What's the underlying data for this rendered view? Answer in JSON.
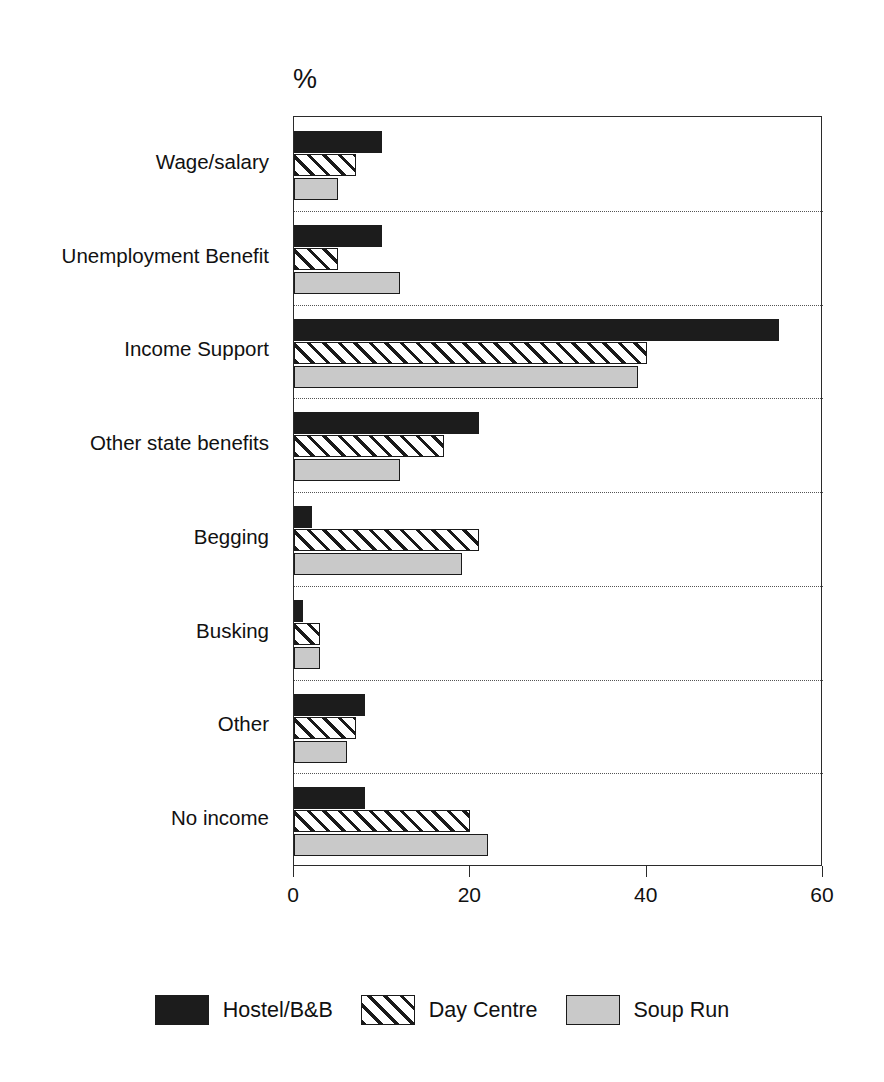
{
  "chart_data": {
    "type": "bar",
    "orientation": "horizontal",
    "title": "",
    "subtitle": "",
    "unit_label": "%",
    "xlabel": "",
    "ylabel": "",
    "xlim": [
      0,
      60
    ],
    "xticks": [
      0,
      20,
      40,
      60
    ],
    "xtick_labels": [
      "0",
      "20",
      "40",
      "60"
    ],
    "grid": "horizontal-dotted-between-groups",
    "legend_position": "bottom-center",
    "categories": [
      "Wage/salary",
      "Unemployment Benefit",
      "Income Support",
      "Other state benefits",
      "Begging",
      "Busking",
      "Other",
      "No income"
    ],
    "series": [
      {
        "name": "Hostel/B&B",
        "fill": "solid-black",
        "color": "#1c1c1c",
        "values": [
          10,
          10,
          55,
          21,
          2,
          1,
          8,
          8
        ]
      },
      {
        "name": "Day Centre",
        "fill": "diagonal-hatch",
        "color": "#ffffff",
        "values": [
          7,
          5,
          40,
          17,
          21,
          3,
          7,
          20
        ]
      },
      {
        "name": "Soup Run",
        "fill": "light-grey",
        "color": "#c9c9c9",
        "values": [
          5,
          12,
          39,
          12,
          19,
          3,
          6,
          22
        ]
      }
    ]
  },
  "legend": {
    "items": [
      {
        "label": "Hostel/B&B"
      },
      {
        "label": "Day Centre"
      },
      {
        "label": "Soup Run"
      }
    ]
  },
  "colors": {
    "hostel": "#1c1c1c",
    "day_centre": "#ffffff",
    "soup_run": "#c9c9c9",
    "axis": "#2b2b2b",
    "grid": "#555555",
    "background": "#ffffff"
  }
}
